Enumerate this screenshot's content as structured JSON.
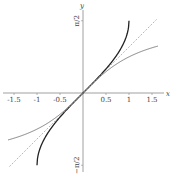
{
  "chart_data": {
    "type": "line",
    "title": "",
    "xlabel": "x",
    "ylabel": "y",
    "xlim": [
      -1.6,
      1.7
    ],
    "ylim": [
      -1.6,
      1.8
    ],
    "grid": false,
    "legend": null,
    "x_ticks": [
      "-1.5",
      "-1",
      "-0.5",
      "0.5",
      "1",
      "1.5"
    ],
    "x_tick_values": [
      -1.5,
      -1,
      -0.5,
      0.5,
      1,
      1.5
    ],
    "y_ticks": [
      "π/2",
      "−π/2"
    ],
    "y_tick_values": [
      1.5708,
      -1.5708
    ],
    "series": [
      {
        "name": "arcsin(x)",
        "style": "solid-dark",
        "color": "#222222",
        "x": [
          -1,
          -0.99,
          -0.95,
          -0.9,
          -0.8,
          -0.6,
          -0.4,
          -0.2,
          0,
          0.2,
          0.4,
          0.6,
          0.8,
          0.9,
          0.95,
          0.99,
          1
        ],
        "y": [
          -1.5708,
          -1.4293,
          -1.2532,
          -1.1198,
          -0.9273,
          -0.6435,
          -0.4115,
          -0.2014,
          0,
          0.2014,
          0.4115,
          0.6435,
          0.9273,
          1.1198,
          1.2532,
          1.4293,
          1.5708
        ]
      },
      {
        "name": "arctan(x)",
        "style": "solid-thin",
        "color": "#666666",
        "x": [
          -1.63,
          -1.4,
          -1.2,
          -1,
          -0.8,
          -0.6,
          -0.4,
          -0.2,
          0,
          0.2,
          0.4,
          0.6,
          0.8,
          1,
          1.2,
          1.4,
          1.63
        ],
        "y": [
          -1.0207,
          -0.9505,
          -0.8761,
          -0.7854,
          -0.6747,
          -0.5404,
          -0.3805,
          -0.1974,
          0,
          0.1974,
          0.3805,
          0.5404,
          0.6747,
          0.7854,
          0.8761,
          0.9505,
          1.0207
        ]
      },
      {
        "name": "y = x",
        "style": "dashed",
        "color": "#999999",
        "x": [
          -1.6,
          1.6
        ],
        "y": [
          -1.6,
          1.6
        ]
      }
    ]
  },
  "layout": {
    "origin_px": [
      83,
      93
    ],
    "scale_px": 46
  }
}
